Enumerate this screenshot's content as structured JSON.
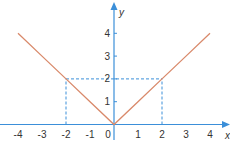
{
  "chart_data": {
    "type": "line",
    "title": "",
    "function": "y = |x|",
    "xlabel": "x",
    "ylabel": "y",
    "xlim": [
      -4,
      4
    ],
    "ylim": [
      0,
      4
    ],
    "x_ticks": [
      "-4",
      "-3",
      "-2",
      "-1",
      "0",
      "1",
      "2",
      "3",
      "4"
    ],
    "y_ticks": [
      "1",
      "2",
      "3",
      "4"
    ],
    "grid": false,
    "series": [
      {
        "name": "y=|x|",
        "x": [
          -4,
          -3,
          -2,
          -1,
          0,
          1,
          2,
          3,
          4
        ],
        "y": [
          4,
          3,
          2,
          1,
          0,
          1,
          2,
          3,
          4
        ]
      }
    ],
    "annotations": [
      {
        "type": "dashed-guide",
        "from": [
          -2,
          0
        ],
        "to": [
          -2,
          2
        ]
      },
      {
        "type": "dashed-guide",
        "from": [
          -2,
          2
        ],
        "to": [
          2,
          2
        ]
      },
      {
        "type": "dashed-guide",
        "from": [
          2,
          0
        ],
        "to": [
          2,
          2
        ]
      }
    ],
    "colors": {
      "line": "#d9896a",
      "axis": "#3b8fd9",
      "guide": "#3b8fd9"
    }
  }
}
